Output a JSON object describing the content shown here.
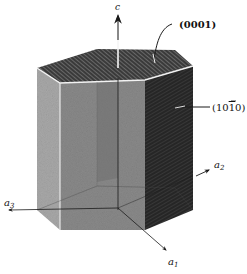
{
  "figure": {
    "axes": {
      "c": "c",
      "a1": "a",
      "a1_sub": "1",
      "a2": "a",
      "a2_sub": "2",
      "a3": "a",
      "a3_sub": "3"
    },
    "planes": {
      "basal": "(0001)",
      "prism_prefix": "(10",
      "prism_bar_digit": "1",
      "prism_suffix": "0)"
    },
    "colors": {
      "top_face": "#3a3a3a",
      "left_face": "#a9a9a9",
      "front_face": "#8a8a8a",
      "front_inner": "#7a7a7a",
      "right_face": "#2a2a2a",
      "edge_highlight": "#f2f2f2",
      "axis": "#1a1a1a"
    }
  }
}
